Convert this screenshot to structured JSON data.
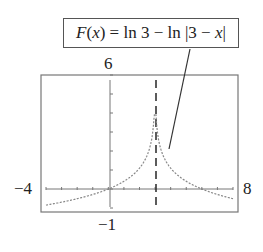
{
  "chart_data": {
    "type": "line",
    "title": "F(x) = ln 3 − ln |3 − x|",
    "function": "F(x) = ln 3 - ln|3 - x|",
    "xlabel": "",
    "ylabel": "",
    "xlim": [
      -4,
      8
    ],
    "ylim": [
      -1,
      6
    ],
    "grid": false,
    "legend": null,
    "annotations": [
      {
        "text": "F(x) = ln 3 − ln |3 − x|",
        "type": "callout-box"
      },
      {
        "text": "vertical asymptote x = 3",
        "type": "dashed-line",
        "x": 3
      }
    ],
    "tick_labels": {
      "x_min": "−4",
      "x_max": "8",
      "y_min": "−1",
      "y_max": "6"
    },
    "series": [
      {
        "name": "F(x)",
        "style": "dotted",
        "x": [
          -4,
          -3,
          -2,
          -1,
          0,
          1,
          2,
          2.5,
          2.8,
          2.9,
          3.1,
          3.2,
          3.5,
          4,
          5,
          6,
          7,
          8
        ],
        "values": [
          -0.85,
          -0.69,
          -0.51,
          -0.29,
          0,
          0.41,
          1.1,
          1.79,
          2.71,
          3.4,
          3.4,
          2.71,
          1.79,
          1.1,
          0.41,
          0,
          -0.29,
          -0.51
        ]
      }
    ]
  },
  "labels": {
    "formula_prefix": "F",
    "formula_var": "x",
    "formula_rest": " = ln 3 − ln |3 − ",
    "formula_var2": "x",
    "formula_end": "|",
    "y_max": "6",
    "y_min": "−1",
    "x_min": "−4",
    "x_max": "8"
  }
}
